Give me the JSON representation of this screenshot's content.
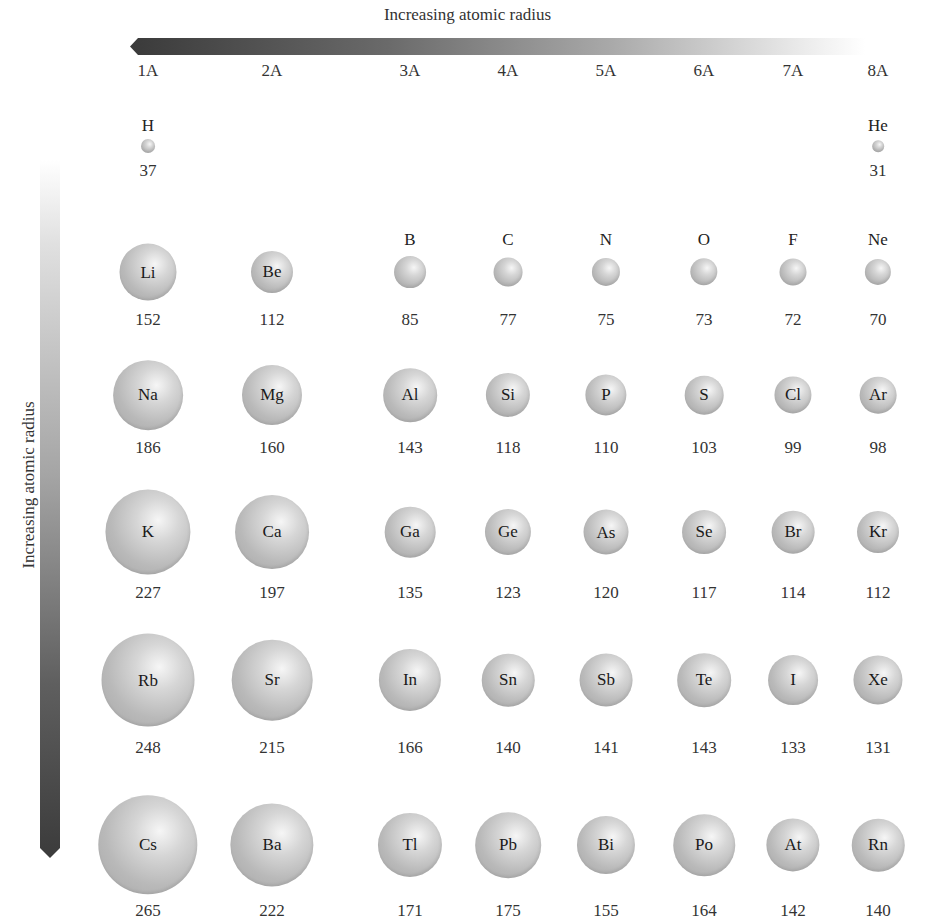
{
  "titles": {
    "horizontal": "Increasing atomic radius",
    "vertical": "Increasing atomic radius"
  },
  "groups": [
    "1A",
    "2A",
    "3A",
    "4A",
    "5A",
    "6A",
    "7A",
    "8A"
  ],
  "colors": {
    "arrow_dark": "#3a3a3a",
    "arrow_light": "#ececec",
    "sphere": "#c0c0c0",
    "text": "#222222"
  },
  "chart_data": {
    "type": "table",
    "columns": [
      "1A",
      "2A",
      "3A",
      "4A",
      "5A",
      "6A",
      "7A",
      "8A"
    ],
    "rows": [
      [
        {
          "symbol": "H",
          "radius": 37
        },
        null,
        null,
        null,
        null,
        null,
        null,
        {
          "symbol": "He",
          "radius": 31
        }
      ],
      [
        {
          "symbol": "Li",
          "radius": 152
        },
        {
          "symbol": "Be",
          "radius": 112
        },
        {
          "symbol": "B",
          "radius": 85
        },
        {
          "symbol": "C",
          "radius": 77
        },
        {
          "symbol": "N",
          "radius": 75
        },
        {
          "symbol": "O",
          "radius": 73
        },
        {
          "symbol": "F",
          "radius": 72
        },
        {
          "symbol": "Ne",
          "radius": 70
        }
      ],
      [
        {
          "symbol": "Na",
          "radius": 186
        },
        {
          "symbol": "Mg",
          "radius": 160
        },
        {
          "symbol": "Al",
          "radius": 143
        },
        {
          "symbol": "Si",
          "radius": 118
        },
        {
          "symbol": "P",
          "radius": 110
        },
        {
          "symbol": "S",
          "radius": 103
        },
        {
          "symbol": "Cl",
          "radius": 99
        },
        {
          "symbol": "Ar",
          "radius": 98
        }
      ],
      [
        {
          "symbol": "K",
          "radius": 227
        },
        {
          "symbol": "Ca",
          "radius": 197
        },
        {
          "symbol": "Ga",
          "radius": 135
        },
        {
          "symbol": "Ge",
          "radius": 123
        },
        {
          "symbol": "As",
          "radius": 120
        },
        {
          "symbol": "Se",
          "radius": 117
        },
        {
          "symbol": "Br",
          "radius": 114
        },
        {
          "symbol": "Kr",
          "radius": 112
        }
      ],
      [
        {
          "symbol": "Rb",
          "radius": 248
        },
        {
          "symbol": "Sr",
          "radius": 215
        },
        {
          "symbol": "In",
          "radius": 166
        },
        {
          "symbol": "Sn",
          "radius": 140
        },
        {
          "symbol": "Sb",
          "radius": 141
        },
        {
          "symbol": "Te",
          "radius": 143
        },
        {
          "symbol": "I",
          "radius": 133
        },
        {
          "symbol": "Xe",
          "radius": 131
        }
      ],
      [
        {
          "symbol": "Cs",
          "radius": 265
        },
        {
          "symbol": "Ba",
          "radius": 222
        },
        {
          "symbol": "Tl",
          "radius": 171
        },
        {
          "symbol": "Pb",
          "radius": 175
        },
        {
          "symbol": "Bi",
          "radius": 155
        },
        {
          "symbol": "Po",
          "radius": 164
        },
        {
          "symbol": "At",
          "radius": 142
        },
        {
          "symbol": "Rn",
          "radius": 140
        }
      ]
    ],
    "annotations": [
      "Increasing atomic radius (arrow pointing left across groups)",
      "Increasing atomic radius (arrow pointing down periods)"
    ]
  }
}
